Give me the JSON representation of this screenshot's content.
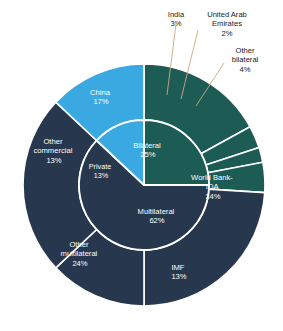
{
  "figure": {
    "background": "#ffffff",
    "title_fragment": "",
    "width": 283,
    "height": 331
  },
  "palette": {
    "teal": "#1d5c55",
    "navy": "#26374e",
    "light_blue": "#3aa9e2",
    "leader_line": "#c9a97c",
    "divider": "#ffffff",
    "label_text": "#ffffff",
    "callout_text": "#1a1a1a"
  },
  "geometry": {
    "cx": 144,
    "cy": 185,
    "outer_radius": 121,
    "inner_radius": 65
  },
  "chart_data": {
    "type": "pie",
    "title": "",
    "subtitle": "",
    "xlabel": "",
    "ylabel": "",
    "legend_position": "none",
    "grid": false,
    "units": "percent",
    "rings": [
      {
        "name": "inner",
        "description": "Creditor category",
        "slices": [
          {
            "label": "Bilateral",
            "value": 25,
            "value_label": "25%",
            "color": "#1d5c55"
          },
          {
            "label": "Multilateral",
            "value": 62,
            "value_label": "62%",
            "color": "#26374e"
          },
          {
            "label": "Private",
            "value": 13,
            "value_label": "13%",
            "color": "#3aa9e2"
          }
        ]
      },
      {
        "name": "outer",
        "description": "Individual creditors",
        "slices": [
          {
            "label": "China",
            "value": 17,
            "value_label": "17%",
            "color": "#1d5c55",
            "parent": "Bilateral",
            "callout": false
          },
          {
            "label": "India",
            "value": 3,
            "value_label": "3%",
            "color": "#1d5c55",
            "parent": "Bilateral",
            "callout": true
          },
          {
            "label": "United Arab Emirates",
            "value": 2,
            "value_label": "2%",
            "color": "#1d5c55",
            "parent": "Bilateral",
            "callout": true
          },
          {
            "label": "Other bilateral",
            "value": 4,
            "value_label": "4%",
            "color": "#1d5c55",
            "parent": "Bilateral",
            "callout": true
          },
          {
            "label": "World Bank-IDA",
            "value": 24,
            "value_label": "24%",
            "color": "#26374e",
            "parent": "Multilateral",
            "callout": false
          },
          {
            "label": "IMF",
            "value": 13,
            "value_label": "13%",
            "color": "#26374e",
            "parent": "Multilateral",
            "callout": false
          },
          {
            "label": "Other multilateral",
            "value": 24,
            "value_label": "24%",
            "color": "#26374e",
            "parent": "Multilateral",
            "callout": false
          },
          {
            "label": "Other commercial",
            "value": 13,
            "value_label": "13%",
            "color": "#3aa9e2",
            "parent": "Private",
            "callout": false
          }
        ]
      }
    ]
  },
  "labels": {
    "inner": {
      "bilateral": {
        "name": "Bilateral",
        "pct": "25%"
      },
      "multilateral": {
        "name": "Multilateral",
        "pct": "62%"
      },
      "private": {
        "name": "Private",
        "pct": "13%"
      }
    },
    "outer": {
      "china": {
        "name": "China",
        "pct": "17%"
      },
      "world_bank_ida": {
        "name": "World Bank-",
        "name2": "IDA",
        "pct": "24%"
      },
      "imf": {
        "name": "IMF",
        "pct": "13%"
      },
      "other_multilateral": {
        "name": "Other",
        "name2": "multilateral",
        "pct": "24%"
      },
      "other_commercial": {
        "name": "Other",
        "name2": "commercial",
        "pct": "13%"
      }
    },
    "callouts": {
      "india": {
        "text": "India\n3%"
      },
      "uae": {
        "text": "United Arab\nEmirates\n2%"
      },
      "other_bilat": {
        "text": "Other\nbilateral\n4%"
      }
    }
  }
}
